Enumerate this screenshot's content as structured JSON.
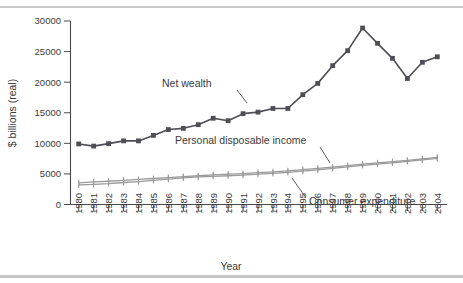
{
  "chart_data": {
    "type": "line",
    "title": "",
    "xlabel": "Year",
    "ylabel": "$ billions (real)",
    "ylim": [
      0,
      30000
    ],
    "ytick_values": [
      0,
      5000,
      10000,
      15000,
      20000,
      25000,
      30000
    ],
    "ytick_labels": [
      "0",
      "5000",
      "10000",
      "15000",
      "20000",
      "25000",
      "30000"
    ],
    "grid": false,
    "legend_position": "inline-annotations",
    "categories": [
      "1980",
      "1981",
      "1982",
      "1983",
      "1984",
      "1985",
      "1986",
      "1987",
      "1988",
      "1989",
      "1990",
      "1991",
      "1992",
      "1993",
      "1994",
      "1995",
      "1996",
      "1997",
      "1998",
      "1999",
      "2000",
      "2001",
      "2002",
      "2003",
      "2004"
    ],
    "series": [
      {
        "name": "Net wealth",
        "color": "#4e4e55",
        "marker": "square",
        "values": [
          9900,
          9550,
          9950,
          10400,
          10400,
          11300,
          12250,
          12450,
          13050,
          14100,
          13700,
          14850,
          15100,
          15700,
          15700,
          17950,
          19800,
          22700,
          25150,
          28850,
          26350,
          23900,
          20600,
          23250,
          24150
        ]
      },
      {
        "name": "Personal disposable income",
        "color": "#9a9a9a",
        "marker": "plus",
        "values": [
          3550,
          3700,
          3800,
          3950,
          4100,
          4250,
          4400,
          4550,
          4700,
          4850,
          4950,
          5050,
          5200,
          5350,
          5500,
          5700,
          5900,
          6100,
          6350,
          6600,
          6800,
          7000,
          7200,
          7450,
          7700
        ]
      },
      {
        "name": "Consumer expenditure",
        "color": "#9a9a9a",
        "marker": "plus",
        "values": [
          3200,
          3300,
          3400,
          3600,
          3750,
          3950,
          4150,
          4350,
          4500,
          4600,
          4700,
          4800,
          4950,
          5100,
          5250,
          5450,
          5650,
          5900,
          6150,
          6400,
          6600,
          6800,
          7050,
          7300,
          7550
        ]
      }
    ],
    "annotations": [
      {
        "text": "Net wealth",
        "id": "annotation-net-wealth"
      },
      {
        "text": "Personal disposable income",
        "id": "annotation-personal-disposable-income"
      },
      {
        "text": "Consumer expenditure",
        "id": "annotation-consumer-expenditure"
      }
    ]
  }
}
